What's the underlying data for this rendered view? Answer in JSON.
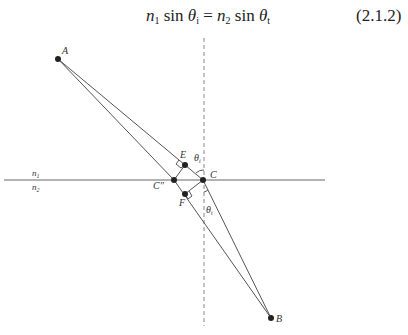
{
  "equation": {
    "n1": "n",
    "n1_sub": "1",
    "sin1": " sin ",
    "theta1": "θ",
    "theta1_sub": "i",
    "equals": " = ",
    "n2": "n",
    "n2_sub": "2",
    "sin2": " sin ",
    "theta2": "θ",
    "theta2_sub": "t",
    "number": "(2.1.2)"
  },
  "diagram": {
    "points": {
      "A": {
        "label": "A",
        "x": 58,
        "y": 59
      },
      "B": {
        "label": "B",
        "x": 271,
        "y": 318
      },
      "C": {
        "label": "C",
        "x": 203,
        "y": 180
      },
      "C2": {
        "label": "C''",
        "x": 174,
        "y": 180
      },
      "E": {
        "label": "E",
        "x": 185,
        "y": 165
      },
      "F": {
        "label": "F",
        "x": 185,
        "y": 194
      }
    },
    "media": {
      "upper": "n",
      "upper_sub": "1",
      "lower": "n",
      "lower_sub": "2"
    },
    "angles": {
      "incident": "θ",
      "incident_sub": "i",
      "refracted": "θ",
      "refracted_sub": "t"
    },
    "colors": {
      "line": "#555555",
      "point": "#222222",
      "dashed": "#888888"
    }
  }
}
